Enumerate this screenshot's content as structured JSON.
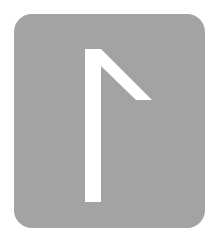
{
  "icon": {
    "name": "laguz-rune-icon",
    "description": "Gray rounded tile with white rune glyph",
    "colors": {
      "tile": "#a3a3a3",
      "glyph": "#ffffff",
      "background": "#ffffff"
    }
  }
}
